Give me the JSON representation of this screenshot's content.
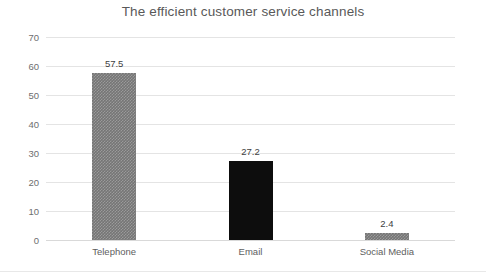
{
  "chart_data": {
    "type": "bar",
    "title": "The efficient customer service channels",
    "xlabel": "",
    "ylabel": "",
    "categories": [
      "Telephone",
      "Email",
      "Social Media"
    ],
    "values": [
      57.5,
      27.2,
      2.4
    ],
    "value_labels": [
      "57.5",
      "27.2",
      "2.4"
    ],
    "bar_colors": [
      "#757575",
      "#0d0d0d",
      "#757575"
    ],
    "ylim": [
      0,
      70
    ],
    "ytick_labels": [
      "0",
      "10",
      "20",
      "30",
      "40",
      "50",
      "60",
      "70"
    ],
    "ytick_values": [
      0,
      10,
      20,
      30,
      40,
      50,
      60,
      70
    ],
    "grid": true,
    "legend": false,
    "legend_position": "none"
  }
}
